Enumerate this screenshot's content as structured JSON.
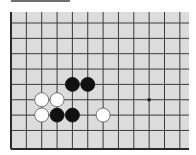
{
  "diagram": {
    "type": "go-board-fragment",
    "visible_columns": 12,
    "visible_rows": 9,
    "edges_shown": [
      "left",
      "bottom"
    ],
    "colors": {
      "board": "#dcdcdc",
      "lines": "#3a3a3a",
      "edge": "#2a2a2a",
      "black_stone": "#111111",
      "white_stone": "#ffffff",
      "white_outline": "#555555",
      "star_point": "#111111",
      "header_bar": "#6e6e6e"
    },
    "stones": [
      {
        "color": "black",
        "col": 4,
        "row": 4
      },
      {
        "color": "black",
        "col": 5,
        "row": 4
      },
      {
        "color": "white",
        "col": 2,
        "row": 5
      },
      {
        "color": "white",
        "col": 3,
        "row": 5
      },
      {
        "color": "white",
        "col": 2,
        "row": 6
      },
      {
        "color": "black",
        "col": 3,
        "row": 6
      },
      {
        "color": "black",
        "col": 4,
        "row": 6
      },
      {
        "color": "white",
        "col": 6,
        "row": 6
      }
    ],
    "star_points": [
      {
        "col": 9,
        "row": 5
      }
    ]
  }
}
